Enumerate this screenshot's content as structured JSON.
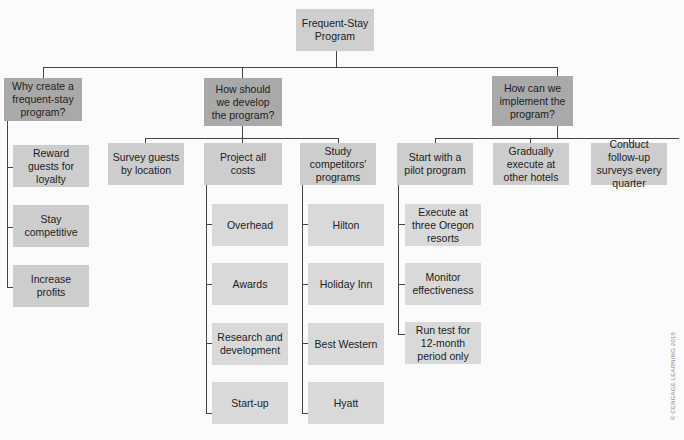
{
  "diagram": {
    "title": "Frequent-Stay Program",
    "root": {
      "label": "Frequent-Stay\nProgram"
    },
    "branches": [
      {
        "label": "Why create a frequent-stay program?",
        "children": [
          {
            "label": "Reward guests for loyalty"
          },
          {
            "label": "Stay competitive"
          },
          {
            "label": "Increase profits"
          }
        ]
      },
      {
        "label": "How should we develop the program?",
        "children": [
          {
            "label": "Survey guests by location",
            "children": []
          },
          {
            "label": "Project all costs",
            "children": [
              {
                "label": "Overhead"
              },
              {
                "label": "Awards"
              },
              {
                "label": "Research and development"
              },
              {
                "label": "Start-up"
              }
            ]
          },
          {
            "label": "Study competitors' programs",
            "children": [
              {
                "label": "Hilton"
              },
              {
                "label": "Holiday Inn"
              },
              {
                "label": "Best Western"
              },
              {
                "label": "Hyatt"
              }
            ]
          }
        ]
      },
      {
        "label": "How can we implement the program?",
        "children": [
          {
            "label": "Start with a pilot program",
            "children": [
              {
                "label": "Execute at three Oregon resorts"
              },
              {
                "label": "Monitor effectiveness"
              },
              {
                "label": "Run test for 12-month period only"
              }
            ]
          },
          {
            "label": "Gradually execute at other hotels",
            "children": []
          },
          {
            "label": "Conduct follow-up surveys every quarter",
            "children": []
          }
        ]
      }
    ],
    "copyright": "© CENGAGE LEARNING 2015"
  },
  "colors": {
    "root": "#cfcfcf",
    "level1": "#a9a9a9",
    "level2": "#cdcdcd",
    "level3": "#d9d9d9",
    "connector": "#444444"
  }
}
